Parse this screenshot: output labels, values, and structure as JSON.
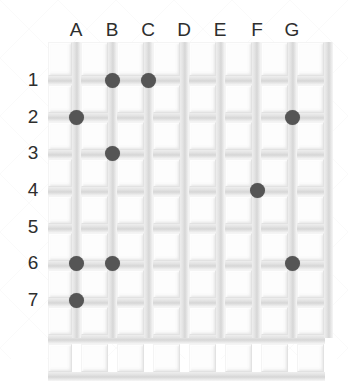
{
  "board": {
    "title": "Peg grid board",
    "columns": [
      "A",
      "B",
      "C",
      "D",
      "E",
      "F",
      "G"
    ],
    "rows": [
      "1",
      "2",
      "3",
      "4",
      "5",
      "6",
      "7"
    ],
    "column_count": 7,
    "row_count": 7,
    "grid_line_count_horizontal": 9,
    "grid_line_count_vertical": 8,
    "colors": {
      "background": "#ffffff",
      "grid_line": "#d6d6d6",
      "cell_fill": "#fdfdfd",
      "dot": "#555555",
      "label_text": "#2e2e2e"
    },
    "geometry": {
      "grid_left": 48,
      "grid_top": 42,
      "grid_width": 277,
      "grid_height": 296,
      "cell_pitch_x": 36,
      "cell_pitch_y": 37,
      "first_intersection_x": 76,
      "first_intersection_y": 80,
      "dot_diameter": 15
    },
    "dots": [
      {
        "id": "dot-B1",
        "col": "B",
        "row": "1",
        "cx": 112,
        "cy": 80
      },
      {
        "id": "dot-C1",
        "col": "C",
        "row": "1",
        "cx": 148,
        "cy": 80
      },
      {
        "id": "dot-A2",
        "col": "A",
        "row": "2",
        "cx": 76,
        "cy": 117
      },
      {
        "id": "dot-G2",
        "col": "G",
        "row": "2",
        "cx": 292,
        "cy": 117
      },
      {
        "id": "dot-B3",
        "col": "B",
        "row": "3",
        "cx": 112,
        "cy": 153
      },
      {
        "id": "dot-F4",
        "col": "F",
        "row": "4",
        "cx": 257,
        "cy": 190
      },
      {
        "id": "dot-A6",
        "col": "A",
        "row": "6",
        "cx": 76,
        "cy": 263
      },
      {
        "id": "dot-B6",
        "col": "B",
        "row": "6",
        "cx": 112,
        "cy": 263
      },
      {
        "id": "dot-G6",
        "col": "G",
        "row": "6",
        "cx": 292,
        "cy": 263
      },
      {
        "id": "dot-A7",
        "col": "A",
        "row": "7",
        "cx": 76,
        "cy": 300
      }
    ]
  }
}
